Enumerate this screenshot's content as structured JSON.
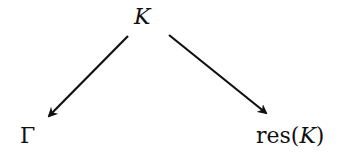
{
  "diagram": {
    "type": "commutative-diagram",
    "nodes": {
      "top": {
        "label": "K",
        "italic": true
      },
      "bottom_left": {
        "label": "Γ",
        "italic": false
      },
      "bottom_right": {
        "prefix": "res(",
        "var": "K",
        "suffix": ")"
      }
    },
    "edges": [
      {
        "from": "top",
        "to": "bottom_left"
      },
      {
        "from": "top",
        "to": "bottom_right"
      }
    ]
  }
}
